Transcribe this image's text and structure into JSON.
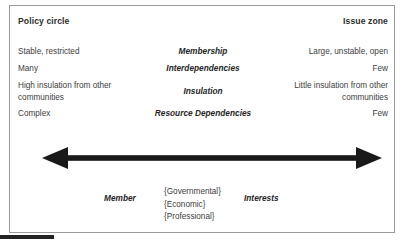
{
  "diagram": {
    "title_left": "Policy circle",
    "title_right": "Issue zone",
    "rows": [
      {
        "dimension": "Membership",
        "left": "Stable, restricted",
        "right": "Large, unstable, open"
      },
      {
        "dimension": "Interdependencies",
        "left": "Many",
        "right": "Few"
      },
      {
        "dimension": "Insulation",
        "left": "High insulation from other communities",
        "right": "Little insulation from other communities"
      },
      {
        "dimension": "Resource Dependencies",
        "left": "Complex",
        "right": "Few"
      }
    ],
    "axis": {
      "icon": "double-headed-arrow-icon",
      "color": "#1a1a1a",
      "direction": "horizontal-bidirectional"
    },
    "footer": {
      "left_label": "Member",
      "right_label": "Interests",
      "categories": [
        "{Governmental}",
        "{Economic}",
        "{Professional}"
      ]
    },
    "colors": {
      "border": "#9a9a9a",
      "text": "#3d3d3d",
      "heading": "#2d2d2d",
      "arrow": "#1a1a1a",
      "background": "#ffffff",
      "artifact": "#232323"
    }
  }
}
